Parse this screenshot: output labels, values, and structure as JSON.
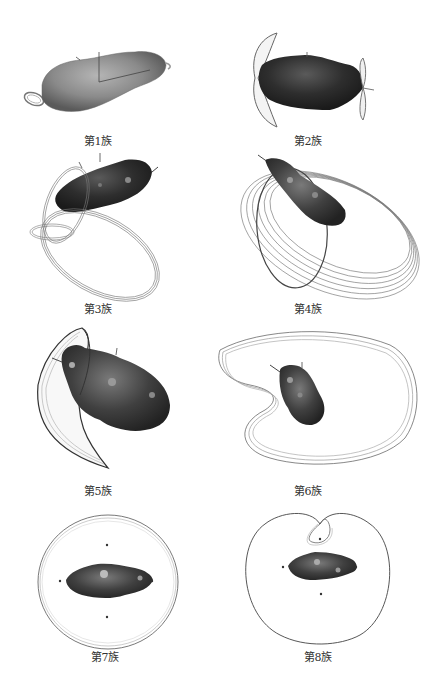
{
  "figure": {
    "panels": [
      {
        "id": 1,
        "caption": "第1族"
      },
      {
        "id": 2,
        "caption": "第2族"
      },
      {
        "id": 3,
        "caption": "第3族"
      },
      {
        "id": 4,
        "caption": "第4族"
      },
      {
        "id": 5,
        "caption": "第5族"
      },
      {
        "id": 6,
        "caption": "第6族"
      },
      {
        "id": 7,
        "caption": "第7族"
      },
      {
        "id": 8,
        "caption": "第8族"
      }
    ],
    "colors": {
      "asteroid_light": "#8a8a8a",
      "asteroid_dark": "#2a2a2a",
      "orbit_line": "#555555",
      "background": "#ffffff"
    }
  }
}
